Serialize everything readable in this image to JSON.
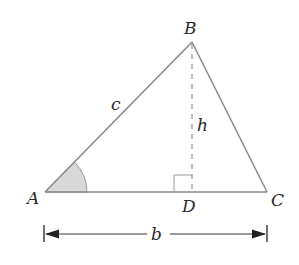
{
  "diagram": {
    "type": "triangle-altitude",
    "colors": {
      "triangle_stroke": "#8a8a8a",
      "altitude_stroke": "#9a9a9a",
      "angle_fill": "#d8d8d8",
      "angle_stroke": "#9a9a9a",
      "dimension_stroke": "#333333",
      "label": "#2a2a2a"
    },
    "vertices": {
      "A": {
        "label": "A",
        "x": 45,
        "y": 192
      },
      "B": {
        "label": "B",
        "x": 192,
        "y": 42
      },
      "C": {
        "label": "C",
        "x": 267,
        "y": 192
      },
      "D": {
        "label": "D",
        "x": 192,
        "y": 192
      }
    },
    "side_labels": {
      "c": "c",
      "h": "h",
      "b": "b"
    },
    "angle_marker": {
      "vertex": "A",
      "radius": 42
    },
    "right_angle_marker": {
      "vertex": "D",
      "size": 18
    },
    "dimension_line": {
      "y": 234,
      "x_start": 44,
      "x_end": 267,
      "label": "b"
    }
  }
}
